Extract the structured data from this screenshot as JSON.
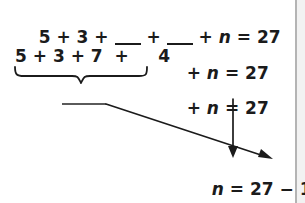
{
  "page": {
    "background_color": "#ffffff",
    "ink_color": "#1b1b1b",
    "rule_color": "#b4b4b4"
  },
  "problem": {
    "line1": {
      "prefix": "5 + 3 + ",
      "blank1": "",
      "mid": " + ",
      "blank2": "",
      "suffix_op": " + ",
      "variable": "n",
      "equals": " = ",
      "result": "27",
      "full_text": "5 + 3 + ___ + ___ + n = 27"
    },
    "line2": {
      "grouped_terms": "5 + 3 + 7  +     4",
      "term_values": [
        "5",
        "3",
        "7",
        "4"
      ],
      "tail_op": "+ ",
      "variable": "n",
      "equals": " = ",
      "result": "27",
      "full_text": "5 + 3 + 7  +   4  + n = 27"
    },
    "line3": {
      "op": "+ ",
      "variable": "n",
      "equals": " = ",
      "result": "27",
      "full_text": "+ n = 27"
    },
    "line4": {
      "variable": "n",
      "equals": " = ",
      "minuend": "27",
      "minus": " − ",
      "subtrahend": "19",
      "full_text": "n = 27 − 19"
    },
    "brace": {
      "label": "underbrace-grouping",
      "covers": "5 + 3 + 7 + 4"
    },
    "blank_sum": {
      "label": "blank-sum-line",
      "value": ""
    },
    "arrows": [
      {
        "name": "arrow-from-blank-sum-to-subtrahend",
        "from": "blank-sum-line",
        "to": "19"
      },
      {
        "name": "arrow-from-result-to-minuend",
        "from": "27",
        "to": "27"
      }
    ]
  }
}
